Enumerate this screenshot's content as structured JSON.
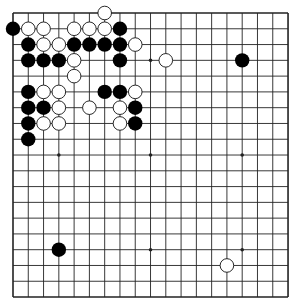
{
  "board": {
    "size": 19,
    "origin": {
      "x": 13,
      "y": 13
    },
    "cell": {
      "w": 15.28,
      "h": 15.78
    },
    "line_color": "#222222",
    "border_width": 1.6,
    "line_width": 0.9,
    "star_points": [
      [
        3,
        3
      ],
      [
        3,
        9
      ],
      [
        3,
        15
      ],
      [
        9,
        3
      ],
      [
        9,
        9
      ],
      [
        9,
        15
      ],
      [
        15,
        3
      ],
      [
        15,
        9
      ],
      [
        15,
        15
      ]
    ],
    "stone_radius": 7.2,
    "colors": {
      "black": "#000000",
      "white": "#ffffff",
      "white_outline": "#111111"
    }
  },
  "stones": {
    "black": [
      [
        1,
        0
      ],
      [
        1,
        7
      ],
      [
        2,
        1
      ],
      [
        2,
        4
      ],
      [
        2,
        5
      ],
      [
        2,
        6
      ],
      [
        2,
        7
      ],
      [
        3,
        1
      ],
      [
        3,
        2
      ],
      [
        3,
        3
      ],
      [
        3,
        7
      ],
      [
        3,
        15
      ],
      [
        5,
        1
      ],
      [
        5,
        6
      ],
      [
        5,
        7
      ],
      [
        6,
        1
      ],
      [
        6,
        2
      ],
      [
        6,
        8
      ],
      [
        7,
        1
      ],
      [
        7,
        8
      ],
      [
        8,
        1
      ],
      [
        15,
        3
      ]
    ],
    "white": [
      [
        0,
        6
      ],
      [
        1,
        1
      ],
      [
        1,
        2
      ],
      [
        1,
        4
      ],
      [
        1,
        5
      ],
      [
        1,
        6
      ],
      [
        2,
        2
      ],
      [
        2,
        3
      ],
      [
        2,
        8
      ],
      [
        3,
        4
      ],
      [
        3,
        10
      ],
      [
        4,
        4
      ],
      [
        5,
        2
      ],
      [
        5,
        3
      ],
      [
        5,
        8
      ],
      [
        6,
        3
      ],
      [
        6,
        5
      ],
      [
        6,
        7
      ],
      [
        7,
        2
      ],
      [
        7,
        3
      ],
      [
        7,
        7
      ],
      [
        16,
        14
      ]
    ]
  }
}
